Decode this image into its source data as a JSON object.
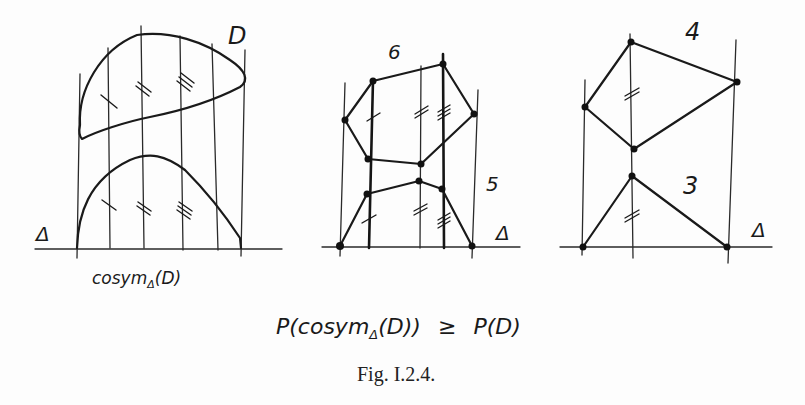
{
  "figure": {
    "caption": "Fig. I.2.4.",
    "formula": "P(cosymΔ(D)) ≥ P(D)",
    "formula_parts": {
      "lhs": "P(cosym",
      "sub": "Δ",
      "mid": "(D))",
      "rel": "≥",
      "rhs": "P(D)"
    }
  },
  "panels": [
    {
      "id": "left",
      "labels": {
        "region": "D",
        "axis": "Δ",
        "below": "cosym",
        "below_sub": "Δ",
        "below_arg": "(D)"
      },
      "description": "Region D bounded by curves with vertical lines; its cosymmetrization sits on axis Δ"
    },
    {
      "id": "middle",
      "labels": {
        "upper_count": "6",
        "lower_count": "5",
        "axis": "Δ"
      },
      "description": "Hexagon (6) above pentagon (5) built on vertical lines over axis Δ"
    },
    {
      "id": "right",
      "labels": {
        "upper_count": "4",
        "lower_count": "3",
        "axis": "Δ"
      },
      "description": "Quadrilateral (4) above triangle (3) built on vertical lines over axis Δ"
    }
  ]
}
